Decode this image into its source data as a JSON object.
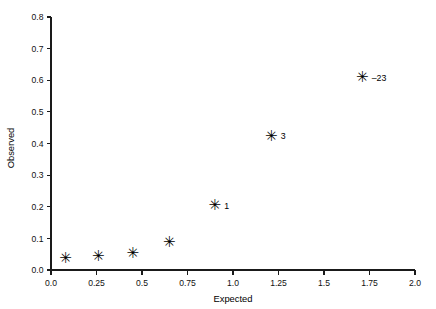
{
  "chart_data": {
    "type": "scatter",
    "title": "",
    "xlabel": "Expected",
    "ylabel": "Observed",
    "xlim": [
      0.0,
      2.0
    ],
    "ylim": [
      0.0,
      0.8
    ],
    "grid": false,
    "legend": "none",
    "marker": "asterisk",
    "marker_glyph": "✳",
    "marker_color": "#000000",
    "axis_color": "#1a1a1a",
    "background_color": "#ffffff",
    "xticks": [
      {
        "value": 0.0,
        "label": "0.0"
      },
      {
        "value": 0.25,
        "label": "0.25"
      },
      {
        "value": 0.5,
        "label": "0.5"
      },
      {
        "value": 0.75,
        "label": "0.75"
      },
      {
        "value": 1.0,
        "label": "1.0"
      },
      {
        "value": 1.25,
        "label": "1.25"
      },
      {
        "value": 1.5,
        "label": "1.5"
      },
      {
        "value": 1.75,
        "label": "1.75"
      },
      {
        "value": 2.0,
        "label": "2.0"
      }
    ],
    "yticks": [
      {
        "value": 0.0,
        "label": "0.0"
      },
      {
        "value": 0.1,
        "label": "0.1"
      },
      {
        "value": 0.2,
        "label": "0.2"
      },
      {
        "value": 0.3,
        "label": "0.3"
      },
      {
        "value": 0.4,
        "label": "0.4"
      },
      {
        "value": 0.5,
        "label": "0.5"
      },
      {
        "value": 0.6,
        "label": "0.6"
      },
      {
        "value": 0.7,
        "label": "0.7"
      },
      {
        "value": 0.8,
        "label": "0.8"
      }
    ],
    "points": [
      {
        "x": 0.08,
        "y": 0.037,
        "label": ""
      },
      {
        "x": 0.26,
        "y": 0.043,
        "label": ""
      },
      {
        "x": 0.45,
        "y": 0.053,
        "label": ""
      },
      {
        "x": 0.65,
        "y": 0.09,
        "label": ""
      },
      {
        "x": 0.9,
        "y": 0.205,
        "label": "1"
      },
      {
        "x": 1.21,
        "y": 0.425,
        "label": "3"
      },
      {
        "x": 1.71,
        "y": 0.61,
        "label": "–23"
      }
    ],
    "annotations": [
      {
        "text": "1",
        "x": 0.9,
        "y": 0.205
      },
      {
        "text": "3",
        "x": 1.21,
        "y": 0.425
      },
      {
        "text": "–23",
        "x": 1.71,
        "y": 0.61
      }
    ]
  }
}
